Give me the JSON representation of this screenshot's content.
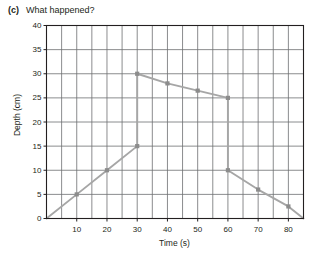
{
  "header": {
    "question_label": "(c)",
    "question_text": "What happened?"
  },
  "chart_data": {
    "type": "line",
    "title": "",
    "xlabel": "Time (s)",
    "ylabel": "Depth (cm)",
    "xlim": [
      0,
      85
    ],
    "ylim": [
      0,
      40
    ],
    "xticks": [
      10,
      20,
      30,
      40,
      50,
      60,
      70,
      80
    ],
    "yticks": [
      0,
      5,
      10,
      15,
      20,
      25,
      30,
      35,
      40
    ],
    "xtick_labels": [
      "10",
      "20",
      "30",
      "40",
      "50",
      "60",
      "70",
      "80"
    ],
    "ytick_labels": [
      "0",
      "5",
      "10",
      "15",
      "20",
      "25",
      "30",
      "35",
      "40"
    ],
    "grid": "major horizontal every 5 cm, vertical every 5 s",
    "x_minor_step": 5,
    "y_major_step": 5,
    "line_color": "#a6a6a6",
    "marker_color": "#8c8c8c",
    "grid_color": "#6d6e71",
    "axis_color": "#231f20",
    "series": [
      {
        "name": "rising-fill",
        "points": [
          {
            "x": 0,
            "y": 0
          },
          {
            "x": 10,
            "y": 5
          },
          {
            "x": 20,
            "y": 10
          },
          {
            "x": 30,
            "y": 15
          }
        ],
        "markers": [
          {
            "x": 10,
            "y": 5
          },
          {
            "x": 20,
            "y": 10
          },
          {
            "x": 30,
            "y": 15
          }
        ]
      },
      {
        "name": "jump-at-30",
        "points": [
          {
            "x": 30,
            "y": 15
          },
          {
            "x": 30,
            "y": 30
          }
        ],
        "markers": []
      },
      {
        "name": "slow-decline",
        "points": [
          {
            "x": 30,
            "y": 30
          },
          {
            "x": 40,
            "y": 28
          },
          {
            "x": 50,
            "y": 26.5
          },
          {
            "x": 60,
            "y": 25
          }
        ],
        "markers": [
          {
            "x": 30,
            "y": 30
          },
          {
            "x": 40,
            "y": 28
          },
          {
            "x": 50,
            "y": 26.5
          },
          {
            "x": 60,
            "y": 25
          }
        ]
      },
      {
        "name": "drop-at-60",
        "points": [
          {
            "x": 60,
            "y": 25
          },
          {
            "x": 60,
            "y": 10
          }
        ],
        "markers": []
      },
      {
        "name": "final-decline",
        "points": [
          {
            "x": 60,
            "y": 10
          },
          {
            "x": 70,
            "y": 6
          },
          {
            "x": 80,
            "y": 2.5
          },
          {
            "x": 85,
            "y": 0
          }
        ],
        "markers": [
          {
            "x": 60,
            "y": 10
          },
          {
            "x": 70,
            "y": 6
          },
          {
            "x": 80,
            "y": 2.5
          }
        ]
      }
    ]
  }
}
